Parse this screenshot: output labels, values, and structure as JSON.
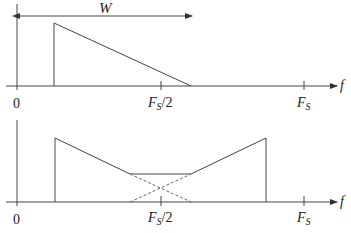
{
  "diagram": {
    "top_panel": {
      "description": "Original bandpass spectrum",
      "width_label": "W",
      "x_axis_label": "f",
      "tick_labels": {
        "zero": "0",
        "half": {
          "main": "F",
          "sub": "S",
          "suffix": "/2"
        },
        "full": {
          "main": "F",
          "sub": "S"
        }
      }
    },
    "bottom_panel": {
      "description": "Sampled spectrum showing aliasing overlap around Fs/2",
      "x_axis_label": "f",
      "tick_labels": {
        "zero": "0",
        "half": {
          "main": "F",
          "sub": "S",
          "suffix": "/2"
        },
        "full": {
          "main": "F",
          "sub": "S"
        }
      }
    },
    "colors": {
      "line": "#444444",
      "dashed": "#666666",
      "background": "#ffffff"
    }
  }
}
